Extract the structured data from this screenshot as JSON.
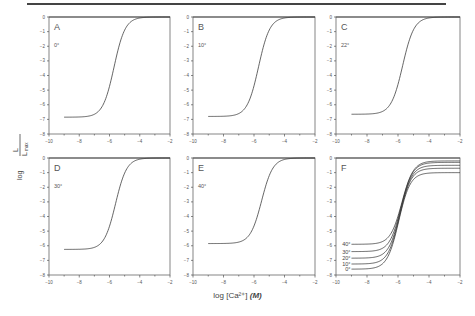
{
  "figure": {
    "ylabel_num": "L",
    "ylabel_den": "L",
    "ylabel_den_sub": "max",
    "ylabel_prefix": "log",
    "xlabel": "log [Ca²⁺] (M)",
    "xlabel_text": "log [Ca²⁺]",
    "xlabel_unit": "(M)"
  },
  "chart_data": [
    {
      "type": "line",
      "panel": "A",
      "annotation": "0°",
      "xlim": [
        -10,
        -2
      ],
      "ylim": [
        -8,
        0
      ],
      "xticks": [
        -10,
        -8,
        -6,
        -4,
        -2
      ],
      "yticks": [
        0,
        -1,
        -2,
        -3,
        -4,
        -5,
        -6,
        -7,
        -8
      ],
      "xlabel": "log [Ca²⁺] (M)",
      "ylabel": "log L/Lmax",
      "series": [
        {
          "name": "0°",
          "x_start": -9,
          "x_end": -2,
          "lower": -6.85,
          "upper": 0.0,
          "midpoint": -5.7,
          "slope": 1.35
        }
      ]
    },
    {
      "type": "line",
      "panel": "B",
      "annotation": "10°",
      "xlim": [
        -10,
        -2
      ],
      "ylim": [
        -8,
        0
      ],
      "xticks": [
        -10,
        -8,
        -6,
        -4,
        -2
      ],
      "yticks": [
        0,
        -1,
        -2,
        -3,
        -4,
        -5,
        -6,
        -7,
        -8
      ],
      "xlabel": "log [Ca²⁺] (M)",
      "ylabel": "log L/Lmax",
      "series": [
        {
          "name": "10°",
          "x_start": -9,
          "x_end": -2,
          "lower": -6.8,
          "upper": 0.0,
          "midpoint": -5.7,
          "slope": 1.35
        }
      ]
    },
    {
      "type": "line",
      "panel": "C",
      "annotation": "22°",
      "xlim": [
        -10,
        -2
      ],
      "ylim": [
        -8,
        0
      ],
      "xticks": [
        -10,
        -8,
        -6,
        -4,
        -2
      ],
      "yticks": [
        0,
        -1,
        -2,
        -3,
        -4,
        -5,
        -6,
        -7,
        -8
      ],
      "xlabel": "log [Ca²⁺] (M)",
      "ylabel": "log L/Lmax",
      "series": [
        {
          "name": "22°",
          "x_start": -9,
          "x_end": -2,
          "lower": -6.65,
          "upper": 0.0,
          "midpoint": -5.7,
          "slope": 1.35
        }
      ]
    },
    {
      "type": "line",
      "panel": "D",
      "annotation": "30°",
      "xlim": [
        -10,
        -2
      ],
      "ylim": [
        -8,
        0
      ],
      "xticks": [
        -10,
        -8,
        -6,
        -4,
        -2
      ],
      "yticks": [
        0,
        -1,
        -2,
        -3,
        -4,
        -5,
        -6,
        -7,
        -8
      ],
      "xlabel": "log [Ca²⁺] (M)",
      "ylabel": "log L/Lmax",
      "series": [
        {
          "name": "30°",
          "x_start": -9,
          "x_end": -2,
          "lower": -6.25,
          "upper": 0.0,
          "midpoint": -5.6,
          "slope": 1.35
        }
      ]
    },
    {
      "type": "line",
      "panel": "E",
      "annotation": "40°",
      "xlim": [
        -10,
        -2
      ],
      "ylim": [
        -8,
        0
      ],
      "xticks": [
        -10,
        -8,
        -6,
        -4,
        -2
      ],
      "yticks": [
        0,
        -1,
        -2,
        -3,
        -4,
        -5,
        -6,
        -7,
        -8
      ],
      "xlabel": "log [Ca²⁺] (M)",
      "ylabel": "log L/Lmax",
      "series": [
        {
          "name": "40°",
          "x_start": -9,
          "x_end": -2,
          "lower": -5.85,
          "upper": 0.0,
          "midpoint": -5.5,
          "slope": 1.35
        }
      ]
    },
    {
      "type": "line",
      "panel": "F",
      "annotation": "",
      "xlim": [
        -10,
        -2
      ],
      "ylim": [
        -8,
        0
      ],
      "xticks": [
        -10,
        -8,
        -6,
        -4,
        -2
      ],
      "yticks": [
        0,
        -1,
        -2,
        -3,
        -4,
        -5,
        -6,
        -7,
        -8
      ],
      "xlabel": "log [Ca²⁺] (M)",
      "ylabel": "log L/Lmax",
      "series": [
        {
          "name": "40°",
          "x_start": -9,
          "x_end": -2,
          "lower": -5.9,
          "upper": -0.2,
          "midpoint": -5.75,
          "slope": 1.35
        },
        {
          "name": "30°",
          "x_start": -9,
          "x_end": -2,
          "lower": -6.4,
          "upper": -0.3,
          "midpoint": -5.8,
          "slope": 1.35
        },
        {
          "name": "20°",
          "x_start": -9,
          "x_end": -2,
          "lower": -6.85,
          "upper": -0.5,
          "midpoint": -5.85,
          "slope": 1.35
        },
        {
          "name": "10°",
          "x_start": -9,
          "x_end": -2,
          "lower": -7.25,
          "upper": -0.7,
          "midpoint": -5.9,
          "slope": 1.35
        },
        {
          "name": "0°",
          "x_start": -9,
          "x_end": -2,
          "lower": -7.6,
          "upper": -1.0,
          "midpoint": -5.95,
          "slope": 1.35
        }
      ]
    }
  ],
  "layout": {
    "panels": [
      {
        "x": 49,
        "y": 17,
        "w": 121,
        "h": 117
      },
      {
        "x": 193,
        "y": 17,
        "w": 122,
        "h": 117
      },
      {
        "x": 336,
        "y": 17,
        "w": 124,
        "h": 117
      },
      {
        "x": 49,
        "y": 158,
        "w": 121,
        "h": 117
      },
      {
        "x": 193,
        "y": 158,
        "w": 122,
        "h": 117
      },
      {
        "x": 336,
        "y": 158,
        "w": 124,
        "h": 117
      }
    ]
  }
}
